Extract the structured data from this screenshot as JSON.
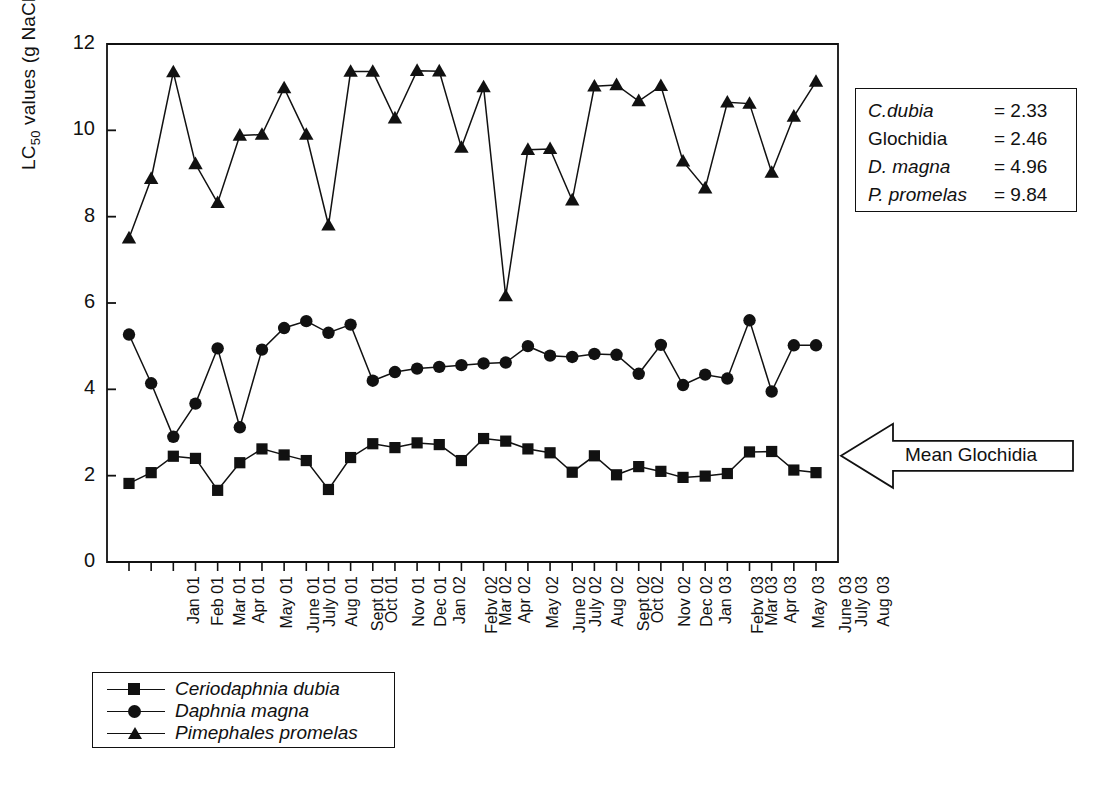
{
  "figure": {
    "ylabel_prefix": "LC",
    "ylabel_sub": "50",
    "ylabel_suffix": " values (g NaCl/L)"
  },
  "stats_box": {
    "rows": [
      {
        "name": "C.dubia",
        "value": "= 2.33",
        "italic": true
      },
      {
        "name": "Glochidia",
        "value": "= 2.46",
        "italic": false
      },
      {
        "name": "D. magna",
        "value": "= 4.96",
        "italic": true
      },
      {
        "name": "P. promelas",
        "value": "= 9.84",
        "italic": true
      }
    ]
  },
  "annotation": {
    "mean_glochidia_label": "Mean Glochidia",
    "mean_glochidia_value": 2.46
  },
  "legend": {
    "entries": [
      {
        "label": "Ceriodaphnia dubia",
        "marker": "square-marker-icon"
      },
      {
        "label": "Daphnia magna",
        "marker": "circle-marker-icon"
      },
      {
        "label": "Pimephales promelas",
        "marker": "triangle-marker-icon"
      }
    ]
  },
  "chart_data": {
    "type": "line",
    "title": "",
    "xlabel": "",
    "ylabel": "LC50 values (g NaCl/L)",
    "ylim": [
      0,
      12
    ],
    "yticks": [
      0,
      2,
      4,
      6,
      8,
      10,
      12
    ],
    "grid": false,
    "legend_position": "below-axes-left",
    "categories": [
      "Jan 01",
      "Feb 01",
      "Mar 01",
      "Apr 01",
      "May 01",
      "June 01",
      "July 01",
      "Aug 01",
      "Sept 01",
      "Oct 01",
      "Nov 01",
      "Dec 01",
      "Jan 02",
      "Febv 02",
      "Mar 02",
      "Apr 02",
      "May 02",
      "June 02",
      "July 02",
      "Aug 02",
      "Sept 02",
      "Oct 02",
      "Nov 02",
      "Dec 02",
      "Jan 03",
      "Febv 03",
      "Mar 03",
      "Apr 03",
      "May 03",
      "June 03",
      "July 03",
      "Aug 03"
    ],
    "series": [
      {
        "name": "Ceriodaphnia dubia",
        "marker": "square",
        "values": [
          1.82,
          2.07,
          2.45,
          2.4,
          1.66,
          2.3,
          2.62,
          2.48,
          2.35,
          1.68,
          2.42,
          2.74,
          2.65,
          2.76,
          2.72,
          2.35,
          2.86,
          2.8,
          2.62,
          2.53,
          2.08,
          2.46,
          2.02,
          2.21,
          2.1,
          1.96,
          1.99,
          2.05,
          2.55,
          2.56,
          2.13,
          2.07
        ]
      },
      {
        "name": "Daphnia magna",
        "marker": "circle",
        "values": [
          5.27,
          4.14,
          2.9,
          3.67,
          4.95,
          3.12,
          4.92,
          5.42,
          5.58,
          5.31,
          5.5,
          4.2,
          4.4,
          4.48,
          4.52,
          4.56,
          4.6,
          4.62,
          5.0,
          4.78,
          4.75,
          4.82,
          4.8,
          4.36,
          5.03,
          4.1,
          4.34,
          4.25,
          5.6,
          3.95,
          5.02,
          5.02
        ]
      },
      {
        "name": "Pimephales promelas",
        "marker": "triangle",
        "values": [
          7.5,
          8.88,
          11.35,
          9.22,
          8.32,
          9.88,
          9.9,
          10.98,
          9.9,
          7.8,
          11.36,
          11.36,
          10.28,
          11.38,
          11.37,
          9.6,
          11.0,
          6.16,
          9.55,
          9.57,
          8.38,
          11.02,
          11.05,
          10.68,
          11.03,
          9.28,
          8.66,
          10.65,
          10.62,
          9.02,
          10.32,
          11.13
        ]
      }
    ]
  }
}
